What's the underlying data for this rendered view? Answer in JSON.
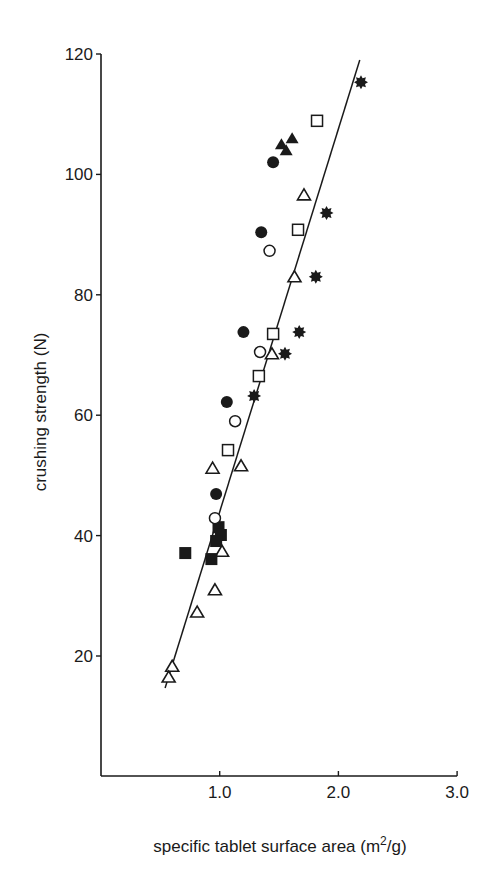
{
  "chart_data": {
    "type": "scatter",
    "title": "",
    "xlabel": "specific tablet surface area (m2/g)",
    "xlabel_parts": {
      "pre": "specific tablet surface area (m",
      "sup": "2",
      "post": "/g)"
    },
    "ylabel": "crushing strength (N)",
    "xlim": [
      0,
      3.0
    ],
    "ylim": [
      0,
      120
    ],
    "x_ticks": [
      1.0,
      2.0,
      3.0
    ],
    "x_tick_labels": [
      "1.0",
      "2.0",
      "3.0"
    ],
    "y_ticks": [
      20,
      40,
      60,
      80,
      100,
      120
    ],
    "y_tick_labels": [
      "20",
      "40",
      "60",
      "80",
      "100",
      "120"
    ],
    "grid": false,
    "legend": null,
    "fit_line": {
      "x": [
        0.54,
        2.18
      ],
      "y": [
        14.7,
        119.0
      ]
    },
    "series": [
      {
        "name": "open-triangle",
        "marker": "triangle-open",
        "points": [
          [
            1.71,
            96.6
          ],
          [
            1.63,
            83.0
          ],
          [
            1.44,
            70.2
          ],
          [
            0.94,
            51.2
          ],
          [
            1.18,
            51.6
          ],
          [
            1.02,
            37.4
          ],
          [
            0.96,
            31.0
          ],
          [
            0.81,
            27.3
          ],
          [
            0.6,
            18.3
          ],
          [
            0.57,
            16.5
          ]
        ]
      },
      {
        "name": "filled-triangle",
        "marker": "triangle-filled",
        "points": [
          [
            1.52,
            105.0
          ],
          [
            1.61,
            106.0
          ],
          [
            1.56,
            104.0
          ]
        ]
      },
      {
        "name": "open-square",
        "marker": "square-open",
        "points": [
          [
            1.82,
            108.9
          ],
          [
            1.66,
            90.8
          ],
          [
            1.45,
            73.5
          ],
          [
            1.33,
            66.5
          ],
          [
            1.07,
            54.2
          ]
        ]
      },
      {
        "name": "filled-square",
        "marker": "square-filled",
        "points": [
          [
            0.99,
            41.4
          ],
          [
            1.01,
            40.1
          ],
          [
            0.97,
            39.1
          ],
          [
            0.71,
            37.1
          ],
          [
            0.93,
            36.1
          ]
        ]
      },
      {
        "name": "open-circle",
        "marker": "circle-open",
        "points": [
          [
            1.42,
            87.3
          ],
          [
            1.34,
            70.5
          ],
          [
            1.13,
            59.0
          ],
          [
            0.96,
            42.9
          ]
        ]
      },
      {
        "name": "filled-circle",
        "marker": "circle-filled",
        "points": [
          [
            1.45,
            102.0
          ],
          [
            1.35,
            90.4
          ],
          [
            1.2,
            73.8
          ],
          [
            1.06,
            62.2
          ],
          [
            0.97,
            46.9
          ]
        ]
      },
      {
        "name": "asterisk",
        "marker": "star-filled",
        "points": [
          [
            2.19,
            115.3
          ],
          [
            1.9,
            93.6
          ],
          [
            1.81,
            83.0
          ],
          [
            1.67,
            73.8
          ],
          [
            1.55,
            70.2
          ],
          [
            1.29,
            63.2
          ]
        ]
      }
    ]
  },
  "colors": {
    "ink": "#1a1a1a",
    "background": "#ffffff"
  }
}
